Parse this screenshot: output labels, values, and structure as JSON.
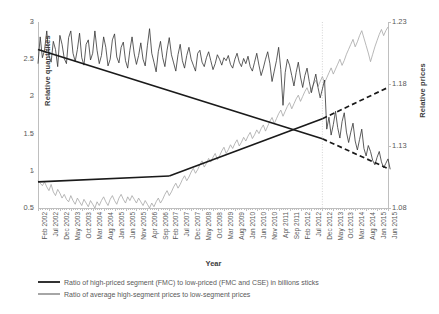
{
  "axes": {
    "y_left_title": "Relative quantitites",
    "y_right_title": "Relative prices",
    "x_title": "Year",
    "y_left_ticks": [
      "0.5",
      "1",
      "1.5",
      "2",
      "2.5",
      "3"
    ],
    "y_right_ticks": [
      "1.08",
      "1.13",
      "1.18",
      "1.23"
    ]
  },
  "legend": {
    "series1_label": "Ratio of high-priced segment (FMC) to low-priced (FMC and CSE) in billions sticks",
    "series2_label": "Ratio of average high-segment prices to low-segment prices",
    "series1_color": "#333333",
    "series2_color": "#a6a6a6"
  },
  "annotation": {
    "breakpoint_label": "Dec 2012"
  },
  "chart_data": {
    "type": "line",
    "title": "",
    "xlabel": "Year",
    "ylabel": "Relative quantitites",
    "y2label": "Relative prices",
    "ylim": [
      0.5,
      3.0
    ],
    "y2lim": [
      1.08,
      1.23
    ],
    "grid": false,
    "legend_position": "bottom",
    "x_tick_labels": [
      "Feb 2002",
      "Jul 2002",
      "Dec 2002",
      "May 2003",
      "Oct 2003",
      "Mar 2004",
      "Aug 2004",
      "Jan 2005",
      "Jun 2005",
      "Nov 2005",
      "Apr 2006",
      "Sep 2006",
      "Feb 2007",
      "Jul 2007",
      "Dec 2007",
      "May 2008",
      "Oct 2008",
      "Mar 2009",
      "Aug 2009",
      "Jan 2010",
      "Jun 2010",
      "Nov 2010",
      "Apr 2011",
      "Sep 2011",
      "Feb 2012",
      "Jul 2012",
      "Dec 2012",
      "May 2013",
      "Oct 2013",
      "Mar 2014",
      "Aug 2014",
      "Jan 2015",
      "Jun 2015"
    ],
    "x_start": "Feb 2002",
    "x_end": "Jun 2015",
    "x_tick_interval_months": 5,
    "n_points": 161,
    "breakpoint_index": 130,
    "breakpoint_label": "Dec 2012",
    "series": [
      {
        "name": "Ratio of high-priced segment (FMC) to low-priced (FMC and CSE) in billions sticks",
        "axis": "left",
        "color": "#333333",
        "values": [
          2.44,
          2.8,
          2.52,
          2.62,
          2.88,
          2.55,
          2.46,
          2.74,
          2.63,
          2.4,
          2.82,
          2.7,
          2.51,
          2.44,
          2.79,
          2.88,
          2.58,
          2.47,
          2.63,
          2.85,
          2.52,
          2.42,
          2.7,
          2.76,
          2.49,
          2.58,
          2.88,
          2.62,
          2.44,
          2.55,
          2.8,
          2.66,
          2.41,
          2.5,
          2.76,
          2.84,
          2.53,
          2.45,
          2.66,
          2.73,
          2.48,
          2.38,
          2.62,
          2.8,
          2.57,
          2.43,
          2.55,
          2.72,
          2.5,
          2.41,
          2.68,
          2.91,
          2.58,
          2.46,
          2.33,
          2.6,
          2.74,
          2.52,
          2.4,
          2.62,
          2.79,
          2.56,
          2.45,
          2.34,
          2.56,
          2.7,
          2.48,
          2.38,
          2.55,
          2.66,
          2.5,
          2.42,
          2.34,
          2.58,
          2.62,
          2.46,
          2.4,
          2.52,
          2.6,
          2.48,
          2.36,
          2.44,
          2.56,
          2.5,
          2.42,
          2.52,
          2.48,
          2.55,
          2.43,
          2.38,
          2.5,
          2.58,
          2.46,
          2.4,
          2.51,
          2.44,
          2.54,
          2.4,
          2.34,
          2.46,
          2.58,
          2.42,
          2.28,
          2.38,
          2.5,
          2.6,
          2.44,
          2.2,
          2.34,
          2.48,
          2.66,
          2.36,
          1.88,
          2.32,
          2.5,
          2.42,
          2.28,
          2.14,
          2.32,
          2.46,
          2.26,
          2.12,
          2.28,
          2.38,
          2.2,
          2.05,
          2.18,
          2.3,
          2.12,
          1.98,
          2.1,
          2.22,
          1.56,
          1.72,
          1.48,
          1.62,
          1.8,
          1.58,
          1.44,
          1.66,
          1.78,
          1.52,
          1.38,
          1.52,
          1.64,
          1.4,
          1.28,
          1.42,
          1.56,
          1.3,
          1.2,
          1.34,
          1.26,
          1.14,
          1.08,
          1.18,
          1.26,
          1.12,
          1.04,
          1.1,
          1.16,
          1.02
        ]
      },
      {
        "name": "Ratio of average high-segment prices to low-segment prices",
        "axis": "right",
        "color": "#a6a6a6",
        "values": [
          1.102,
          1.1,
          1.098,
          1.101,
          1.097,
          1.094,
          1.099,
          1.093,
          1.09,
          1.095,
          1.092,
          1.088,
          1.091,
          1.087,
          1.085,
          1.09,
          1.086,
          1.083,
          1.088,
          1.085,
          1.082,
          1.087,
          1.084,
          1.081,
          1.086,
          1.083,
          1.08,
          1.085,
          1.082,
          1.086,
          1.089,
          1.085,
          1.082,
          1.087,
          1.09,
          1.086,
          1.083,
          1.088,
          1.091,
          1.087,
          1.084,
          1.089,
          1.086,
          1.09,
          1.087,
          1.084,
          1.088,
          1.085,
          1.082,
          1.086,
          1.083,
          1.08,
          1.084,
          1.081,
          1.085,
          1.088,
          1.084,
          1.087,
          1.091,
          1.094,
          1.09,
          1.093,
          1.097,
          1.1,
          1.096,
          1.099,
          1.103,
          1.106,
          1.102,
          1.105,
          1.109,
          1.112,
          1.108,
          1.111,
          1.115,
          1.118,
          1.113,
          1.116,
          1.12,
          1.117,
          1.121,
          1.124,
          1.119,
          1.122,
          1.126,
          1.129,
          1.124,
          1.127,
          1.131,
          1.128,
          1.132,
          1.135,
          1.13,
          1.133,
          1.137,
          1.134,
          1.138,
          1.141,
          1.136,
          1.139,
          1.143,
          1.14,
          1.144,
          1.147,
          1.142,
          1.146,
          1.15,
          1.153,
          1.148,
          1.152,
          1.156,
          1.159,
          1.154,
          1.158,
          1.162,
          1.165,
          1.16,
          1.164,
          1.168,
          1.171,
          1.166,
          1.17,
          1.174,
          1.177,
          1.172,
          1.176,
          1.18,
          1.183,
          1.178,
          1.182,
          1.186,
          1.181,
          1.185,
          1.189,
          1.193,
          1.188,
          1.192,
          1.196,
          1.2,
          1.195,
          1.199,
          1.204,
          1.208,
          1.212,
          1.216,
          1.21,
          1.214,
          1.219,
          1.223,
          1.217,
          1.211,
          1.205,
          1.198,
          1.204,
          1.21,
          1.215,
          1.22,
          1.224,
          1.219,
          1.223,
          1.226
        ]
      }
    ],
    "trend_lines": [
      {
        "series": "quantity",
        "segment": "pre-break",
        "style": "solid",
        "color": "#1a1a1a",
        "x_from": "Feb 2002",
        "x_to": "Dec 2012",
        "y_from": 2.63,
        "y_to": 1.43,
        "axis": "left"
      },
      {
        "series": "quantity",
        "segment": "post-break",
        "style": "dashed",
        "color": "#1a1a1a",
        "x_from": "Dec 2012",
        "x_to": "Jun 2015",
        "y_from": 1.43,
        "y_to": 1.03,
        "axis": "left"
      },
      {
        "series": "price",
        "segment": "pre-break-1",
        "style": "solid",
        "color": "#1a1a1a",
        "x_from": "Feb 2002",
        "x_to": "Feb 2007",
        "y_from": 0.85,
        "y_to": 0.93,
        "axis": "left"
      },
      {
        "series": "price",
        "segment": "pre-break-2",
        "style": "solid",
        "color": "#1a1a1a",
        "x_from": "Feb 2007",
        "x_to": "Dec 2012",
        "y_from": 0.93,
        "y_to": 1.7,
        "axis": "left"
      },
      {
        "series": "price",
        "segment": "post-break",
        "style": "dashed",
        "color": "#1a1a1a",
        "x_from": "Dec 2012",
        "x_to": "Jun 2015",
        "y_from": 1.7,
        "y_to": 2.12,
        "axis": "left"
      }
    ]
  }
}
